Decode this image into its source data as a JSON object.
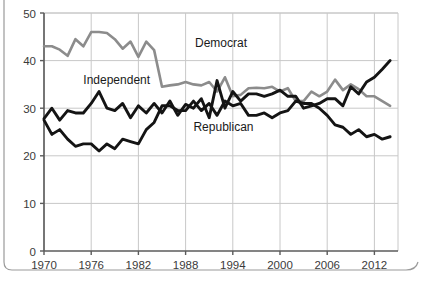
{
  "figure": {
    "background_color": "#ffffff",
    "axis_color": "#5b5b5b",
    "grid_color": "#c8c8c8",
    "border_color": "#9a9a9a"
  },
  "chart_data": {
    "type": "line",
    "title": "",
    "subtitle": "",
    "xlabel": "",
    "ylabel": "",
    "xlim": [
      1970,
      2015
    ],
    "ylim": [
      0,
      50
    ],
    "xticks": [
      1970,
      1976,
      1982,
      1988,
      1994,
      2000,
      2006,
      2012
    ],
    "xtick_labels": [
      "1970",
      "1976",
      "1982",
      "1988",
      "1994",
      "2000",
      "2006",
      "2012"
    ],
    "yticks": [
      0,
      10,
      20,
      30,
      40,
      50
    ],
    "ytick_labels": [
      "0",
      "10",
      "20",
      "30",
      "40",
      "50"
    ],
    "grid": true,
    "legend": "inline-annotations",
    "annotations": [
      {
        "text": "Democrat",
        "x": 1989.2,
        "y": 42.8,
        "series": "Democrat"
      },
      {
        "text": "Independent",
        "x": 1975.0,
        "y": 35.0,
        "series": "Independent"
      },
      {
        "text": "Republican",
        "x": 1989.0,
        "y": 25.2,
        "series": "Republican"
      }
    ],
    "x": [
      1970,
      1971,
      1972,
      1973,
      1974,
      1975,
      1976,
      1977,
      1978,
      1979,
      1980,
      1981,
      1982,
      1983,
      1984,
      1985,
      1986,
      1987,
      1988,
      1989,
      1990,
      1991,
      1992,
      1993,
      1994,
      1995,
      1996,
      1997,
      1998,
      1999,
      2000,
      2001,
      2002,
      2003,
      2004,
      2005,
      2006,
      2007,
      2008,
      2009,
      2010,
      2011,
      2012,
      2013,
      2014
    ],
    "series": [
      {
        "name": "Democrat",
        "color": "#8c8c8c",
        "values": [
          43.0,
          43.0,
          42.3,
          41.0,
          44.5,
          43.0,
          46.0,
          46.0,
          45.8,
          44.5,
          42.5,
          44.0,
          40.8,
          44.0,
          42.2,
          34.5,
          34.8,
          35.0,
          35.5,
          35.0,
          34.8,
          35.5,
          33.5,
          36.5,
          32.5,
          32.8,
          34.2,
          34.3,
          34.2,
          34.5,
          33.5,
          34.2,
          31.5,
          31.5,
          33.5,
          32.5,
          33.5,
          36.0,
          33.8,
          35.0,
          34.0,
          32.5,
          32.5,
          31.5,
          30.5
        ]
      },
      {
        "name": "Independent",
        "color": "#141414",
        "values": [
          27.8,
          30.0,
          27.5,
          29.5,
          29.0,
          29.0,
          31.0,
          33.5,
          30.0,
          29.5,
          31.0,
          28.0,
          30.5,
          29.0,
          31.0,
          29.0,
          31.5,
          28.5,
          30.8,
          30.0,
          32.0,
          28.0,
          35.8,
          30.0,
          33.5,
          31.5,
          33.0,
          33.0,
          32.5,
          33.0,
          33.8,
          32.5,
          32.5,
          30.0,
          30.5,
          31.0,
          32.0,
          32.0,
          30.5,
          34.5,
          33.0,
          35.5,
          36.5,
          38.2,
          40.0
        ]
      },
      {
        "name": "Republican",
        "color": "#141414",
        "values": [
          27.5,
          24.5,
          25.5,
          23.5,
          22.0,
          22.5,
          22.5,
          21.0,
          22.5,
          21.5,
          23.5,
          23.0,
          22.5,
          25.5,
          27.0,
          30.5,
          30.5,
          29.5,
          29.5,
          31.5,
          29.5,
          31.0,
          28.5,
          31.5,
          30.5,
          31.0,
          28.5,
          28.5,
          29.0,
          28.0,
          29.0,
          29.5,
          31.5,
          31.0,
          31.0,
          30.0,
          28.5,
          26.5,
          26.0,
          24.5,
          25.5,
          24.0,
          24.5,
          23.5,
          24.0
        ]
      }
    ]
  }
}
